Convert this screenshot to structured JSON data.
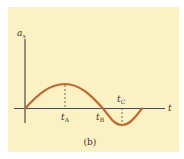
{
  "figure": {
    "caption": "(b)",
    "y_axis_label": "a",
    "y_axis_subscript": "x",
    "x_axis_label": "t",
    "markers": [
      {
        "name": "t",
        "sub": "A"
      },
      {
        "name": "t",
        "sub": "B"
      },
      {
        "name": "t",
        "sub": "C"
      }
    ],
    "colors": {
      "background": "#fbf2c4",
      "curve": "#c8642a",
      "axis": "#4a4a4a"
    }
  }
}
